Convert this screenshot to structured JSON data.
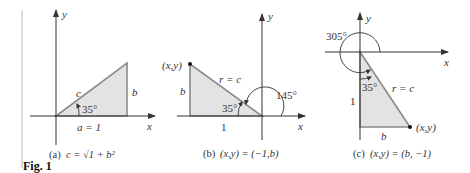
{
  "figure": {
    "label": "Fig. 1",
    "colors": {
      "triangle_fill": "#e3e3e3",
      "triangle_edge": "#8a8a8a",
      "axis": "#333333",
      "text": "#333333"
    },
    "panels": [
      {
        "id": "a",
        "axis_x": "x",
        "axis_y": "y",
        "hyp_label": "c",
        "side_label": "b",
        "base_label": "a = 1",
        "angle_label": "35°",
        "caption_prefix": "(a)",
        "caption": "c = √1 + b²"
      },
      {
        "id": "b",
        "axis_x": "x",
        "axis_y": "y",
        "point_label": "(x,y)",
        "hyp_label": "r = c",
        "side_label": "b",
        "base_label": "1",
        "angle_label": "35°",
        "big_angle_label": "145°",
        "caption_prefix": "(b)",
        "caption": "(x,y) = (−1,b)"
      },
      {
        "id": "c",
        "axis_x": "x",
        "axis_y": "y",
        "point_label": "(x,y)",
        "hyp_label": "r = c",
        "side_label": "1",
        "base_label": "b",
        "angle_label": "35°",
        "big_angle_label": "305°",
        "caption_prefix": "(c)",
        "caption": "(x,y) = (b, −1)"
      }
    ]
  }
}
